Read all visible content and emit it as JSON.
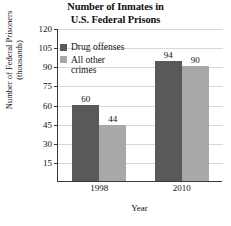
{
  "chart_data": {
    "type": "bar",
    "title": "Number of Inmates in U.S. Federal Prisons",
    "title_lines": [
      "Number of Inmates in",
      "U.S. Federal Prisons"
    ],
    "xlabel": "Year",
    "ylabel": "Number of Federal Prisoners (thousands)",
    "ylabel_lines": [
      "Number of Federal Prisoners",
      "(thousands)"
    ],
    "categories": [
      "1998",
      "2010"
    ],
    "series": [
      {
        "name": "Drug offenses",
        "name_lines": [
          "Drug offenses"
        ],
        "color": "#595959",
        "values": [
          60,
          94
        ]
      },
      {
        "name": "All other crimes",
        "name_lines": [
          "All other",
          "crimes"
        ],
        "color": "#a8a8a8",
        "values": [
          44,
          90
        ]
      }
    ],
    "ylim": [
      0,
      120
    ],
    "ytick_labels": [
      "15",
      "30",
      "45",
      "60",
      "75",
      "90",
      "105",
      "120"
    ],
    "ytick_values": [
      15,
      30,
      45,
      60,
      75,
      90,
      105,
      120
    ],
    "grid": true,
    "legend_position": "top-left-inside",
    "bar_value_labels": [
      [
        "60",
        "44"
      ],
      [
        "94",
        "90"
      ]
    ]
  }
}
